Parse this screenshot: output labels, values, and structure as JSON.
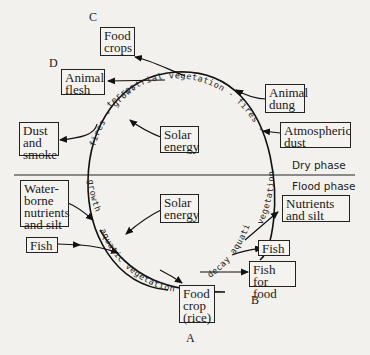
{
  "labels": {
    "C": "C",
    "D": "D",
    "B": "B",
    "A": "A"
  },
  "boxes": {
    "food_crops": "Food\ncrops",
    "animal_flesh": "Animal\nflesh",
    "animal_dung": "Animal\ndung",
    "atmospheric_dust": "Atmospheric\ndust",
    "dust_and_smoke": "Dust\nand\nsmoke",
    "solar_energy_dry": "Solar\nenergy",
    "solar_energy_flood": "Solar\nenergy",
    "waterborne": "Water-\nborne\nnutrients\nand silt",
    "fish_in": "Fish",
    "nutrients_and_silt": "Nutrients\nand silt",
    "fish_out": "Fish",
    "fish_for_food": "Fish for\nfood",
    "food_crop_rice": "Food\ncrop\n(rice)"
  },
  "phases": {
    "dry": "Dry  phase",
    "flood": "Flood  phase"
  },
  "cycle_text": {
    "top": "terrestrial   vegetation  -  fires  -",
    "right": "vegetation",
    "left_top": "- fires - growth",
    "left_bottom": "growth",
    "bottom": "aquatic   vegetation     -",
    "right_bottom": "decay   aquatic"
  }
}
